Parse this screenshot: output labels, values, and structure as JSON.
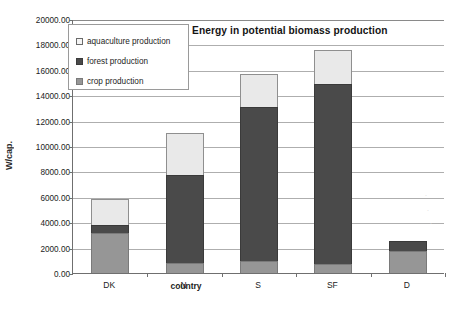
{
  "chart_data": {
    "type": "bar",
    "bar_mode": "stacked",
    "title": "Energy in potential biomass production",
    "xlabel": "country",
    "ylabel": "W/cap.",
    "categories": [
      "DK",
      "N",
      "S",
      "SF",
      "D"
    ],
    "series": [
      {
        "name": "crop production",
        "values": [
          3150,
          780,
          950,
          700,
          1750
        ]
      },
      {
        "name": "forest production",
        "values": [
          650,
          6920,
          12100,
          14150,
          800
        ]
      },
      {
        "name": "aquaculture production",
        "values": [
          2000,
          3350,
          2650,
          2750,
          0
        ]
      }
    ],
    "totals": [
      5800,
      11050,
      15700,
      17600,
      2550
    ],
    "ylim": [
      0,
      20000
    ],
    "ytick_step": 2000,
    "ytick_labels": [
      "0.00",
      "2000.00",
      "4000.00",
      "6000.00",
      "8000.00",
      "10000.00",
      "12000.00",
      "14000.00",
      "16000.00",
      "18000.00",
      "20000.00"
    ],
    "grid": true,
    "legend_position": "top-left-inside",
    "colors": {
      "crop production": "#969696",
      "forest production": "#4a4a4a",
      "aquaculture production": "#e9e9e9",
      "gridline": "#aeaeae",
      "axis": "#6f6f6f",
      "background": "#ffffff"
    }
  },
  "legend": {
    "items": [
      {
        "label": "aquaculture production",
        "swatch": "sw-aqua"
      },
      {
        "label": "forest production",
        "swatch": "sw-forest"
      },
      {
        "label": "crop production",
        "swatch": "sw-crop"
      }
    ]
  }
}
